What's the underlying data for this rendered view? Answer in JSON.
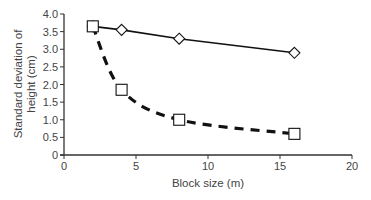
{
  "chart_data": {
    "type": "line",
    "title": "",
    "xlabel": "Block size (m)",
    "ylabel_lines": [
      "Standard deviation of",
      "height (cm)"
    ],
    "ylabel": "Standard deviation of height (cm)",
    "xlim": [
      0,
      20
    ],
    "ylim": [
      0,
      4.0
    ],
    "x_ticks": [
      0,
      5,
      10,
      15,
      20
    ],
    "x_tick_labels": [
      "0",
      "5",
      "10",
      "15",
      "20"
    ],
    "y_ticks": [
      0,
      0.5,
      1.0,
      1.5,
      2.0,
      2.5,
      3.0,
      3.5,
      4.0
    ],
    "y_tick_labels": [
      "0",
      "0.5",
      "1.0",
      "1.5",
      "2.0",
      "2.5",
      "3.0",
      "3.5",
      "4.0"
    ],
    "grid": false,
    "legend": null,
    "series": [
      {
        "name": "Diamond series (solid line)",
        "marker": "diamond",
        "line_style": "solid",
        "x": [
          2,
          4,
          8,
          16
        ],
        "values": [
          3.65,
          3.55,
          3.3,
          2.9
        ]
      },
      {
        "name": "Square series (dashed curve)",
        "marker": "square",
        "line_style": "dashed",
        "x": [
          2,
          4,
          8,
          16
        ],
        "values": [
          3.65,
          1.85,
          1.0,
          0.6
        ]
      }
    ]
  },
  "colors": {
    "axis": "#333333",
    "line": "#111111",
    "marker_fill": "#ffffff",
    "text": "#444444"
  }
}
